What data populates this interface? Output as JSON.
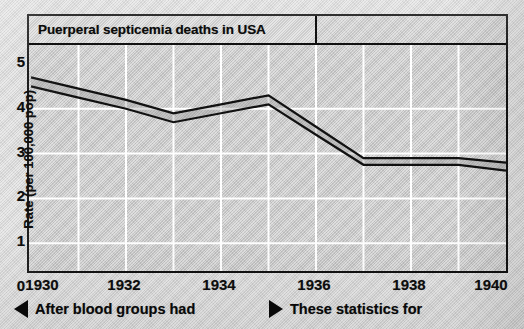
{
  "chart_data": {
    "type": "line",
    "title": "Puerperal septicemia deaths in USA",
    "xlabel": "",
    "ylabel": "Rate (per 100,000 pop)",
    "xlim": [
      1930,
      1940
    ],
    "ylim": [
      0,
      5
    ],
    "grid": true,
    "legend": "none",
    "x_ticks": [
      1930,
      1932,
      1934,
      1936,
      1938,
      1940
    ],
    "x_tick_labels": [
      "1930",
      "1932",
      "1934",
      "1936",
      "1938",
      "1940"
    ],
    "x_minor_ticks": [
      1931,
      1933,
      1935,
      1937,
      1939
    ],
    "y_ticks": [
      0,
      1,
      2,
      3,
      4,
      5
    ],
    "y_tick_labels": [
      "0",
      "1",
      "2",
      "3",
      "4",
      "5"
    ],
    "x": [
      1930,
      1931,
      1932,
      1933,
      1934,
      1935,
      1936,
      1937,
      1938,
      1939,
      1940
    ],
    "series": [
      {
        "name": "upper band edge",
        "values": [
          4.7,
          4.45,
          4.2,
          3.9,
          4.1,
          4.3,
          3.6,
          2.9,
          2.9,
          2.9,
          2.8
        ]
      },
      {
        "name": "lower band edge",
        "values": [
          4.5,
          4.25,
          4.0,
          3.7,
          3.9,
          4.1,
          3.42,
          2.75,
          2.75,
          2.75,
          2.62
        ]
      }
    ],
    "annotations": []
  },
  "chart": {
    "title": "Puerperal septicemia deaths in USA",
    "y_axis_title": "Rate (per 100,000 pop)"
  },
  "captions": {
    "left": {
      "marker": "triangle-left",
      "text": "After blood groups had"
    },
    "right": {
      "marker": "triangle-right",
      "text": "These statistics for"
    }
  },
  "colors": {
    "ink": "#111111",
    "plot_background": "#cfcfcf",
    "gridline": "#ffffff",
    "page_background": "#d9d9d9"
  }
}
